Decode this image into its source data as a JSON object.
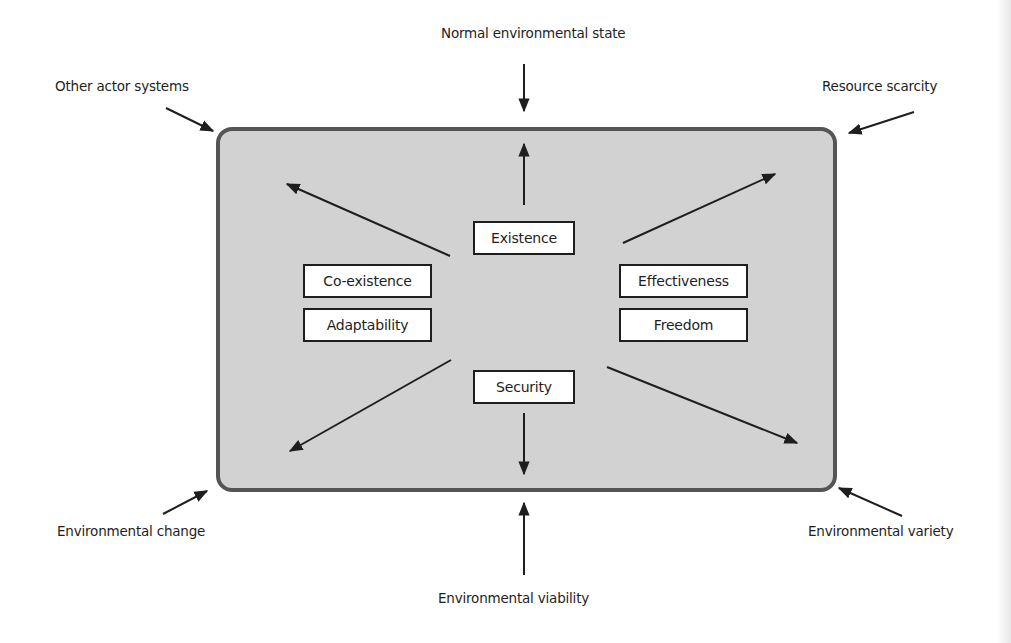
{
  "diagram": {
    "external_influences": {
      "top": "Normal environmental state",
      "top_left": "Other actor systems",
      "top_right": "Resource scarcity",
      "bottom_left": "Environmental change",
      "bottom_right": "Environmental variety",
      "bottom": "Environmental viability"
    },
    "orientors": {
      "existence": "Existence",
      "co_existence": "Co-existence",
      "adaptability": "Adaptability",
      "effectiveness": "Effectiveness",
      "freedom": "Freedom",
      "security": "Security"
    },
    "colors": {
      "system_fill": "#d2d2d2",
      "system_border": "#555555",
      "arrow": "#1e1e1e",
      "value_box_fill": "#ffffff"
    }
  }
}
